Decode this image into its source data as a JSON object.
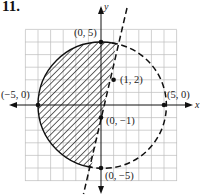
{
  "problem": {
    "number": "11."
  },
  "axes": {
    "x_label": "x",
    "y_label": "y"
  },
  "figure": {
    "grid_range": {
      "x": [
        -6,
        6
      ],
      "y": [
        -6,
        6
      ]
    },
    "circle": {
      "center": [
        0,
        0
      ],
      "radius": 5,
      "style": "solid on shaded arc, dashed elsewhere"
    },
    "line": {
      "equation": "y = 3x - 1",
      "style": "dashed"
    },
    "shaded_region": "inside circle, left of line",
    "points": [
      {
        "label": "(0, 5)",
        "x": 0,
        "y": 5
      },
      {
        "label": "(−5, 0)",
        "x": -5,
        "y": 0
      },
      {
        "label": "(5, 0)",
        "x": 5,
        "y": 0
      },
      {
        "label": "(0, −5)",
        "x": 0,
        "y": -5
      },
      {
        "label": "(1, 2)",
        "x": 1,
        "y": 2
      },
      {
        "label": "(0, −1)",
        "x": 0,
        "y": -1
      }
    ]
  }
}
